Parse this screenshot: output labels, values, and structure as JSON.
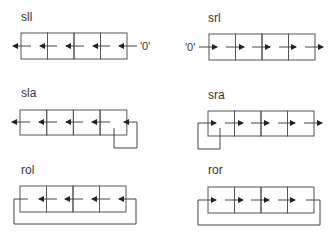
{
  "diagrams": [
    {
      "id": "sll",
      "label": "sll",
      "direction": "left",
      "input": "'0'",
      "loop": "none",
      "cells": 4
    },
    {
      "id": "srl",
      "label": "srl",
      "direction": "right",
      "input": "'0'",
      "loop": "none",
      "cells": 4
    },
    {
      "id": "sla",
      "label": "sla",
      "direction": "left",
      "input": "",
      "loop": "last-cell-feedback",
      "cells": 4
    },
    {
      "id": "sra",
      "label": "sra",
      "direction": "right",
      "input": "",
      "loop": "first-cell-feedback",
      "cells": 4
    },
    {
      "id": "rol",
      "label": "rol",
      "direction": "left",
      "input": "",
      "loop": "rotate-around",
      "cells": 4
    },
    {
      "id": "ror",
      "label": "ror",
      "direction": "right",
      "input": "",
      "loop": "rotate-around",
      "cells": 4
    }
  ],
  "colors": {
    "line": "#444444",
    "text": "#333333",
    "background": "#ffffff"
  }
}
